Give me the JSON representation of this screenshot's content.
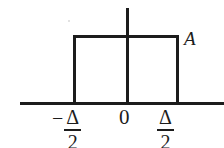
{
  "figure": {
    "background_color": "#ffffff",
    "line_color": "#1c1c1c"
  },
  "labels": {
    "amplitude": "A",
    "origin": "0",
    "left_tick": {
      "sign": "−",
      "numerator": "Δ",
      "denominator": "2"
    },
    "right_tick": {
      "numerator": "Δ",
      "denominator": "2"
    }
  },
  "chart_data": {
    "type": "line",
    "title": "",
    "xlabel": "",
    "ylabel": "",
    "x": [
      -1.6,
      -0.5,
      -0.5,
      0.5,
      0.5,
      1.6
    ],
    "y": [
      0,
      0,
      1,
      1,
      0,
      0
    ],
    "tick_labels_x": [
      "−Δ/2",
      "0",
      "Δ/2"
    ],
    "tick_values_x": [
      -0.5,
      0,
      0.5
    ],
    "tick_labels_y": [
      "A"
    ],
    "tick_values_y": [
      1
    ],
    "series": [
      {
        "name": "rect pulse",
        "values": [
          0,
          0,
          1,
          1,
          0,
          0
        ]
      }
    ],
    "grid": false,
    "legend": false,
    "annotations": [
      {
        "text": "A",
        "x": 0.55,
        "y": 1.0,
        "note": "amplitude label at top-right of pulse"
      }
    ],
    "xlim": [
      -1.7,
      1.7
    ],
    "ylim": [
      0,
      1.35
    ]
  }
}
